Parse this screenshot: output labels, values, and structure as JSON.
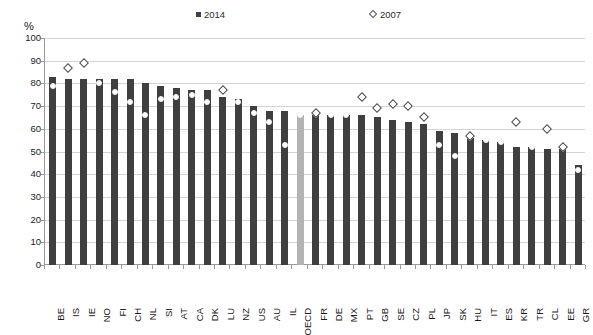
{
  "chart": {
    "type": "bar",
    "unit_label": "%",
    "title": "",
    "xlabel": "",
    "ylabel": ""
  },
  "legend": {
    "position": "top-center",
    "entries": [
      {
        "label": "2014",
        "marker": "filled-square",
        "color": "#3f3f3f"
      },
      {
        "label": "2007",
        "marker": "open-diamond",
        "color": "#ffffff"
      }
    ]
  },
  "axis": {
    "y_ticks": [
      "100",
      "90",
      "80",
      "70",
      "60",
      "50",
      "40",
      "30",
      "20",
      "10",
      "0"
    ],
    "y_min": 0,
    "y_max": 100,
    "y_step": 10,
    "grid": true
  },
  "colors": {
    "bar": "#3f3f3f",
    "bar_highlight": "#b3b3b3",
    "marker_outline": "#4a4a4a",
    "grid": "#d4d4d4",
    "axis": "#9a9a9a"
  },
  "chart_data": {
    "type": "bar",
    "title": "",
    "xlabel": "",
    "ylabel": "%",
    "ylim": [
      0,
      100
    ],
    "grid": true,
    "legend_position": "top-center",
    "highlight_category": "OECD",
    "categories": [
      "BE",
      "IS",
      "IE",
      "NO",
      "FI",
      "CH",
      "NL",
      "SI",
      "AT",
      "CA",
      "DK",
      "LU",
      "NZ",
      "US",
      "AU",
      "IL",
      "OECD",
      "FR",
      "DE",
      "MX",
      "PT",
      "GB",
      "SE",
      "CZ",
      "PL",
      "JP",
      "SK",
      "HU",
      "IT",
      "ES",
      "KR",
      "TR",
      "CL",
      "EE",
      "GR"
    ],
    "series": [
      {
        "name": "2014",
        "type": "bar",
        "values": [
          83,
          82,
          82,
          82,
          82,
          82,
          80,
          79,
          78,
          77,
          77,
          74,
          73,
          70,
          68,
          68,
          66,
          66,
          66,
          66,
          66,
          65,
          64,
          63,
          62,
          59,
          58,
          56,
          55,
          54,
          52,
          52,
          51,
          51,
          44
        ]
      },
      {
        "name": "2007",
        "type": "scatter",
        "marker": "open-diamond",
        "values": [
          79,
          87,
          89,
          80,
          76,
          72,
          66,
          73,
          74,
          75,
          72,
          77,
          72,
          67,
          63,
          53,
          66,
          67,
          66,
          66,
          74,
          69,
          71,
          70,
          65,
          53,
          48,
          57,
          55,
          54,
          63,
          52,
          60,
          52,
          42
        ]
      }
    ]
  }
}
